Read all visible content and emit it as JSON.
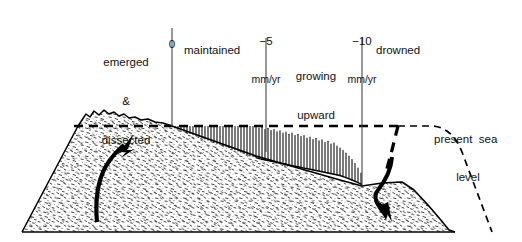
{
  "figure": {
    "type": "geological-cross-section"
  },
  "zones": [
    {
      "id": "emerged-dissected",
      "line1": "emerged",
      "line2": "&",
      "line3": "dissected"
    },
    {
      "id": "maintained",
      "label": "maintained"
    },
    {
      "id": "growing-upward",
      "line1": "growing",
      "line2": "upward"
    },
    {
      "id": "drowned",
      "label": "drowned"
    }
  ],
  "ticks": [
    {
      "id": "tick-0",
      "value": "0",
      "unit": ""
    },
    {
      "id": "tick-5",
      "value": "−5",
      "unit": "mm/yr"
    },
    {
      "id": "tick-10",
      "value": "−10",
      "unit": "mm/yr"
    }
  ],
  "annotations": {
    "sea_level": {
      "line1": "present  sea",
      "line2": "level"
    }
  },
  "arrows": [
    {
      "id": "uplift-arrow",
      "direction": "up",
      "meaning": "uplift / emergence"
    },
    {
      "id": "subsidence-arrow",
      "direction": "down",
      "meaning": "subsidence / drowning"
    }
  ],
  "colors": {
    "ink": "#000000",
    "background": "#ffffff",
    "stipple": "#2b2b2b"
  }
}
